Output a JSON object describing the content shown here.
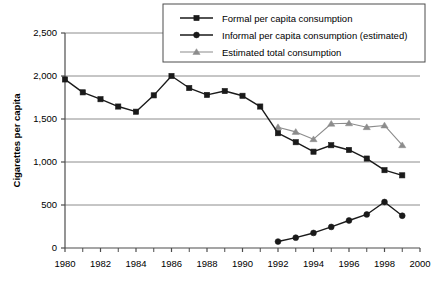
{
  "chart_data": {
    "type": "line",
    "title": "",
    "xlabel": "",
    "ylabel": "Cigarettes per capita",
    "xlim": [
      1980,
      2000
    ],
    "ylim": [
      0,
      2500
    ],
    "ytick_values": [
      0,
      500,
      1000,
      1500,
      2000,
      2500
    ],
    "ytick_labels": [
      "0",
      "500",
      "1,000",
      "1,500",
      "2,000",
      "2,500"
    ],
    "xtick_values": [
      1980,
      1982,
      1984,
      1986,
      1988,
      1990,
      1992,
      1994,
      1996,
      1998,
      2000
    ],
    "xtick_labels": [
      "1980",
      "1982",
      "1984",
      "1986",
      "1988",
      "1990",
      "1992",
      "1994",
      "1996",
      "1998",
      "2000"
    ],
    "xtick_minor_values": [
      1981,
      1983,
      1985,
      1987,
      1989,
      1991,
      1993,
      1995,
      1997,
      1999
    ],
    "grid": "horizontal",
    "legend_position": "top-right",
    "series": [
      {
        "name": "Formal per capita consumption",
        "marker": "square",
        "color": "#1a1a1a",
        "x": [
          1980,
          1981,
          1982,
          1983,
          1984,
          1985,
          1986,
          1987,
          1988,
          1989,
          1990,
          1991,
          1992,
          1993,
          1994,
          1995,
          1996,
          1997,
          1998,
          1999
        ],
        "values": [
          1960,
          1810,
          1730,
          1645,
          1585,
          1775,
          2000,
          1860,
          1780,
          1825,
          1770,
          1645,
          1335,
          1230,
          1120,
          1195,
          1140,
          1040,
          905,
          845
        ]
      },
      {
        "name": "Informal per capita consumption (estimated)",
        "marker": "circle",
        "color": "#1a1a1a",
        "x": [
          1992,
          1993,
          1994,
          1995,
          1996,
          1997,
          1998,
          1999
        ],
        "values": [
          75,
          120,
          175,
          245,
          320,
          390,
          535,
          375
        ]
      },
      {
        "name": "Estimated total consumption",
        "marker": "triangle",
        "color": "#8c8c8c",
        "x": [
          1992,
          1993,
          1994,
          1995,
          1996,
          1997,
          1998,
          1999
        ],
        "values": [
          1405,
          1350,
          1265,
          1445,
          1450,
          1405,
          1425,
          1195
        ]
      }
    ]
  },
  "legend": {
    "entries": [
      "Formal per capita consumption",
      "Informal per capita consumption (estimated)",
      "Estimated total consumption"
    ]
  }
}
